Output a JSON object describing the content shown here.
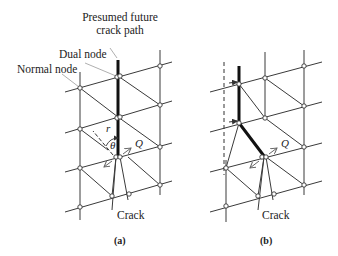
{
  "figure": {
    "labels": {
      "future_path": "Presumed future crack path",
      "future_path_line1": "Presumed future",
      "future_path_line2": "crack path",
      "dual_node": "Dual node",
      "normal_node": "Normal node"
    },
    "panels": [
      {
        "caption": "(a)",
        "crack_label": "Crack",
        "symbols": {
          "r": "r",
          "theta": "θ",
          "Q": "Q"
        }
      },
      {
        "caption": "(b)",
        "crack_label": "Crack",
        "symbols": {
          "Q": "Q"
        }
      }
    ],
    "colors": {
      "line": "#3a3a3a",
      "crack_path": "#111111",
      "leader": "#9a9a9a",
      "node_fill": "#ffffff",
      "arrow": "#555555"
    }
  }
}
